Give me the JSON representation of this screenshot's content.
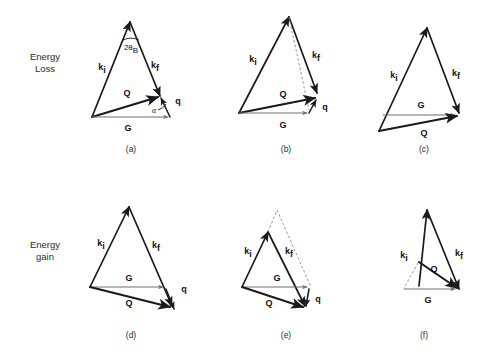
{
  "figure": {
    "background_color": "#ffffff",
    "ink_color": "#1a1a1a",
    "grey_color": "#6f6f6f",
    "width": 489,
    "height": 357
  },
  "row_labels": {
    "loss_line1": "Energy",
    "loss_line2": "Loss",
    "gain_line1": "Energy",
    "gain_line2": "gain"
  },
  "vector_labels": {
    "ki": "k",
    "ki_sub": "i",
    "kf": "k",
    "kf_sub": "f",
    "Q": "Q",
    "G": "G",
    "q": "q",
    "alpha": "α",
    "bragg_num": "2θ",
    "bragg_sub": "B"
  },
  "panels": [
    {
      "id": "a",
      "label": "(a)",
      "row": "Energy Loss",
      "has_q": true,
      "has_alpha": true,
      "has_bragg_angle": true,
      "has_dashed": false,
      "G_above_Q": false
    },
    {
      "id": "b",
      "label": "(b)",
      "row": "Energy Loss",
      "has_q": true,
      "has_alpha": false,
      "has_bragg_angle": false,
      "has_dashed": true,
      "G_above_Q": false
    },
    {
      "id": "c",
      "label": "(c)",
      "row": "Energy Loss",
      "has_q": false,
      "has_alpha": false,
      "has_bragg_angle": false,
      "has_dashed": false,
      "G_above_Q": true
    },
    {
      "id": "d",
      "label": "(d)",
      "row": "Energy gain",
      "has_q": true,
      "has_alpha": false,
      "has_bragg_angle": false,
      "has_dashed": false,
      "G_above_Q": true
    },
    {
      "id": "e",
      "label": "(e)",
      "row": "Energy gain",
      "has_q": true,
      "has_alpha": false,
      "has_bragg_angle": false,
      "has_dashed": true,
      "G_above_Q": true
    },
    {
      "id": "f",
      "label": "(f)",
      "row": "Energy gain",
      "has_q": false,
      "has_alpha": false,
      "has_bragg_angle": false,
      "has_dashed": true,
      "G_above_Q": false
    }
  ]
}
